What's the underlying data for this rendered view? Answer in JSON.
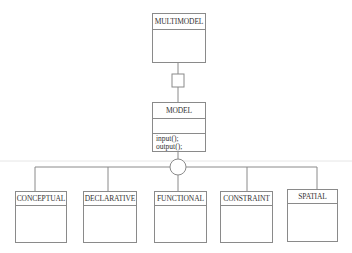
{
  "diagram": {
    "type": "uml-class-diagram",
    "classes": {
      "multimodel": {
        "name": "MULTIMODEL"
      },
      "model": {
        "name": "MODEL",
        "methods": [
          "input();",
          "output();"
        ]
      },
      "subclasses": [
        {
          "name": "CONCEPTUAL"
        },
        {
          "name": "DECLARATIVE"
        },
        {
          "name": "FUNCTIONAL"
        },
        {
          "name": "CONSTRAINT"
        },
        {
          "name": "SPATIAL"
        }
      ]
    },
    "relations": [
      {
        "from": "MULTIMODEL",
        "to": "MODEL",
        "kind": "aggregation-square"
      },
      {
        "from": "MODEL",
        "to": [
          "CONCEPTUAL",
          "DECLARATIVE",
          "FUNCTIONAL",
          "CONSTRAINT",
          "SPATIAL"
        ],
        "kind": "generalization-circle"
      }
    ],
    "colors": {
      "line": "#8a8a8a",
      "text": "#333333",
      "background": "#ffffff"
    }
  }
}
